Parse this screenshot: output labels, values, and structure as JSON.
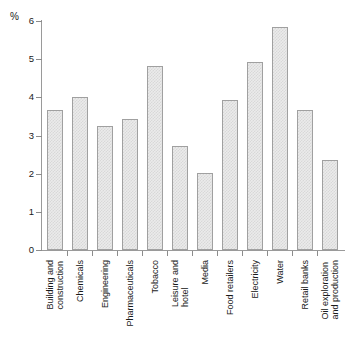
{
  "chart_data": {
    "type": "bar",
    "title": "",
    "xlabel": "",
    "ylabel": "%",
    "ylim": [
      0,
      6
    ],
    "ytick_labels": [
      "0",
      "1",
      "2",
      "3",
      "4",
      "5",
      "6"
    ],
    "ytick_values": [
      0,
      1,
      2,
      3,
      4,
      5,
      6
    ],
    "grid": false,
    "legend": false,
    "categories": [
      "Building and construction",
      "Chemicals",
      "Engineering",
      "Pharmaceuticals",
      "Tobacco",
      "Leisure and hotel",
      "Media",
      "Food retailers",
      "Electricity",
      "Water",
      "Retail banks",
      "Oil exploration and production"
    ],
    "category_lines": [
      [
        "Building and",
        "construction"
      ],
      [
        "Chemicals"
      ],
      [
        "Engineering"
      ],
      [
        "Pharmaceuticals"
      ],
      [
        "Tobacco"
      ],
      [
        "Leisure and",
        "hotel"
      ],
      [
        "Media"
      ],
      [
        "Food retailers"
      ],
      [
        "Electricity"
      ],
      [
        "Water"
      ],
      [
        "Retail banks"
      ],
      [
        "Oil exploration",
        "and production"
      ]
    ],
    "values": [
      3.67,
      4.0,
      3.25,
      3.42,
      4.83,
      2.72,
      2.02,
      3.92,
      4.92,
      5.85,
      3.67,
      2.35
    ],
    "colors": {
      "bar_fill": "#ebebeb",
      "bar_pattern": "#d8d8d8",
      "bar_border": "#a0a0a0",
      "axis": "#9a9a9a",
      "text": "#1a1a1a",
      "background": "#ffffff"
    }
  }
}
